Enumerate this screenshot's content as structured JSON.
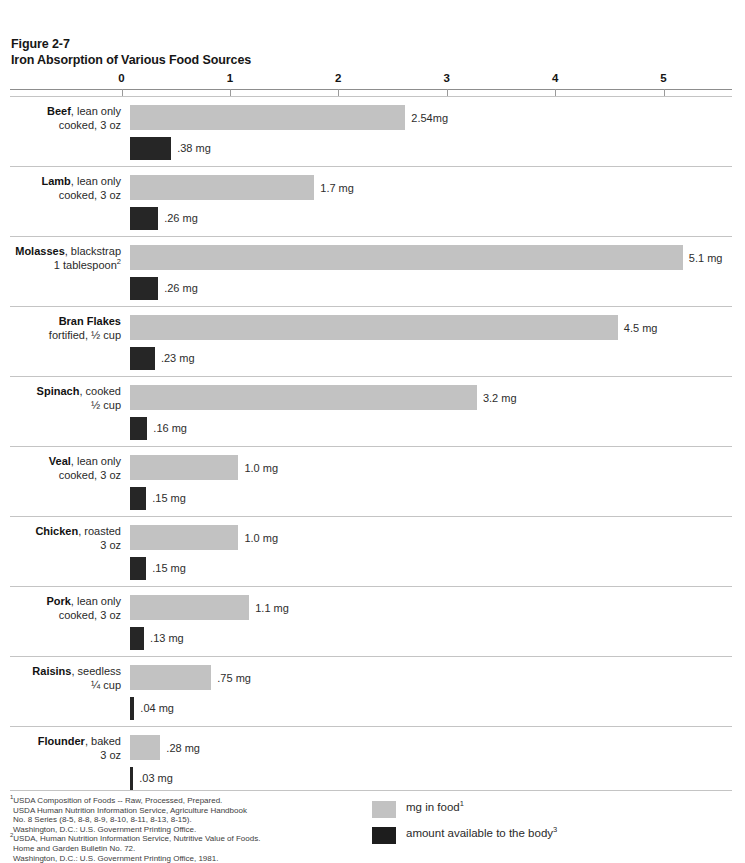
{
  "header": {
    "figure_number": "Figure 2-7",
    "title": "Iron Absorption of Various Food Sources"
  },
  "chart_data": {
    "type": "bar",
    "title": "Iron Absorption of Various Food Sources",
    "xlabel": "",
    "ylabel": "",
    "xlim": [
      0,
      5.5
    ],
    "grid": false,
    "orientation": "horizontal",
    "legend_position": "bottom-right",
    "axis_ticks": [
      {
        "label": "0",
        "value": 0
      },
      {
        "label": "1",
        "value": 1
      },
      {
        "label": "2",
        "value": 2
      },
      {
        "label": "3",
        "value": 3
      },
      {
        "label": "4",
        "value": 4
      },
      {
        "label": "5",
        "value": 5
      }
    ],
    "categories": [
      "Beef, lean only cooked, 3 oz",
      "Lamb, lean only cooked, 3 oz",
      "Molasses, blackstrap 1 tablespoon",
      "Bran Flakes fortified, ½ cup",
      "Spinach, cooked ½ cup",
      "Veal, lean only cooked, 3 oz",
      "Chicken, roasted 3 oz",
      "Pork, lean only cooked, 3 oz",
      "Raisins, seedless ¼ cup",
      "Flounder, baked 3 oz"
    ],
    "series": [
      {
        "name": "mg in food",
        "color": "#c2c2c2",
        "values": [
          2.54,
          1.7,
          5.1,
          4.5,
          3.2,
          1.0,
          1.0,
          1.1,
          0.75,
          0.28
        ]
      },
      {
        "name": "amount available to the body",
        "color": "#262626",
        "values": [
          0.38,
          0.26,
          0.26,
          0.23,
          0.16,
          0.15,
          0.15,
          0.13,
          0.04,
          0.03
        ]
      }
    ]
  },
  "rows": [
    {
      "name_bold": "Beef",
      "name_rest": ", lean only",
      "line2": "cooked, 3 oz",
      "line2_sup": "",
      "food_value": 2.54,
      "food_label": "2.54mg",
      "body_value": 0.38,
      "body_label": ".38 mg"
    },
    {
      "name_bold": "Lamb",
      "name_rest": ", lean only",
      "line2": "cooked, 3 oz",
      "line2_sup": "",
      "food_value": 1.7,
      "food_label": "1.7 mg",
      "body_value": 0.26,
      "body_label": ".26 mg"
    },
    {
      "name_bold": "Molasses",
      "name_rest": ", blackstrap",
      "line2": "1 tablespoon",
      "line2_sup": "2",
      "food_value": 5.1,
      "food_label": "5.1 mg",
      "body_value": 0.26,
      "body_label": ".26 mg"
    },
    {
      "name_bold": "Bran Flakes",
      "name_rest": "",
      "line2": "fortified, ½ cup",
      "line2_sup": "",
      "food_value": 4.5,
      "food_label": "4.5 mg",
      "body_value": 0.23,
      "body_label": ".23 mg"
    },
    {
      "name_bold": "Spinach",
      "name_rest": ", cooked",
      "line2": "½ cup",
      "line2_sup": "",
      "food_value": 3.2,
      "food_label": "3.2 mg",
      "body_value": 0.16,
      "body_label": ".16 mg"
    },
    {
      "name_bold": "Veal",
      "name_rest": ", lean only",
      "line2": "cooked, 3 oz",
      "line2_sup": "",
      "food_value": 1.0,
      "food_label": "1.0 mg",
      "body_value": 0.15,
      "body_label": ".15 mg"
    },
    {
      "name_bold": "Chicken",
      "name_rest": ", roasted",
      "line2": "3 oz",
      "line2_sup": "",
      "food_value": 1.0,
      "food_label": "1.0 mg",
      "body_value": 0.15,
      "body_label": ".15 mg"
    },
    {
      "name_bold": "Pork",
      "name_rest": ", lean only",
      "line2": "cooked, 3 oz",
      "line2_sup": "",
      "food_value": 1.1,
      "food_label": "1.1 mg",
      "body_value": 0.13,
      "body_label": ".13 mg"
    },
    {
      "name_bold": "Raisins",
      "name_rest": ", seedless",
      "line2": "¼ cup",
      "line2_sup": "",
      "food_value": 0.75,
      "food_label": ".75 mg",
      "body_value": 0.04,
      "body_label": ".04 mg"
    },
    {
      "name_bold": "Flounder",
      "name_rest": ", baked",
      "line2": "3 oz",
      "line2_sup": "",
      "food_value": 0.28,
      "food_label": ".28 mg",
      "body_value": 0.03,
      "body_label": ".03 mg"
    }
  ],
  "legend": [
    {
      "swatch": "food",
      "text": "mg in food",
      "sup": "1"
    },
    {
      "swatch": "body",
      "text": "amount available to the body",
      "sup": "3"
    }
  ],
  "footnotes": [
    {
      "sup": "1",
      "text": "USDA Composition of Foods -- Raw, Processed, Prepared.",
      "indent": false
    },
    {
      "sup": "",
      "text": "USDA Human Nutrition Information Service, Agriculture Handbook",
      "indent": true
    },
    {
      "sup": "",
      "text": "No. 8 Series (8-5, 8-8, 8-9, 8-10, 8-11, 8-13, 8-15).",
      "indent": true
    },
    {
      "sup": "",
      "text": "Washington, D.C.: U.S. Government Printing Office.",
      "indent": true
    },
    {
      "sup": "2",
      "text": "USDA, Human Nutrition Information Service, Nutritive Value of Foods.",
      "indent": false
    },
    {
      "sup": "",
      "text": "Home and Garden Bulletin No. 72.",
      "indent": true
    },
    {
      "sup": "",
      "text": "Washington, D.C.: U.S. Government Printing Office, 1981.",
      "indent": true
    }
  ],
  "colors": {
    "bar_food": "#c2c2c2",
    "bar_body": "#262626",
    "rule": "#c4c4c4",
    "axis": "#8d8d8d"
  }
}
